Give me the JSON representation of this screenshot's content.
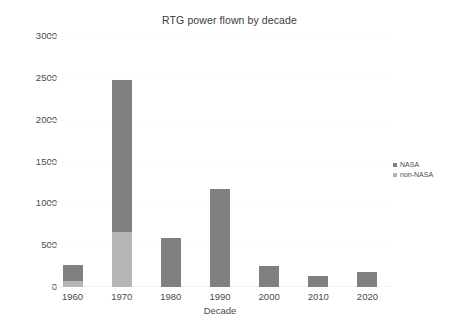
{
  "chart_data": {
    "type": "bar",
    "subtype": "stacked-bar",
    "title": "RTG power flown by decade",
    "xlabel": "Decade",
    "ylabel": "",
    "categories": [
      "1960",
      "1970",
      "1980",
      "1990",
      "2000",
      "2010",
      "2020"
    ],
    "series": [
      {
        "name": "non-NASA",
        "color": "#b5b5b5",
        "values": [
          75,
          660,
          0,
          0,
          0,
          0,
          0
        ]
      },
      {
        "name": "NASA",
        "color": "#808080",
        "values": [
          190,
          1810,
          580,
          1170,
          250,
          130,
          185
        ]
      }
    ],
    "stack_totals": [
      265,
      2470,
      580,
      1170,
      250,
      130,
      185
    ],
    "ylim": [
      0,
      3000
    ],
    "yticks": [
      0,
      500,
      1000,
      1500,
      2000,
      2500,
      3000
    ],
    "ytick_labels": [
      "0",
      "500",
      "1000",
      "1500",
      "2000",
      "2500",
      "3000"
    ],
    "grid": true,
    "legend_position": "right",
    "legend_entries": [
      {
        "label": "NASA",
        "color": "#808080"
      },
      {
        "label": "non-NASA",
        "color": "#b5b5b5"
      }
    ]
  }
}
